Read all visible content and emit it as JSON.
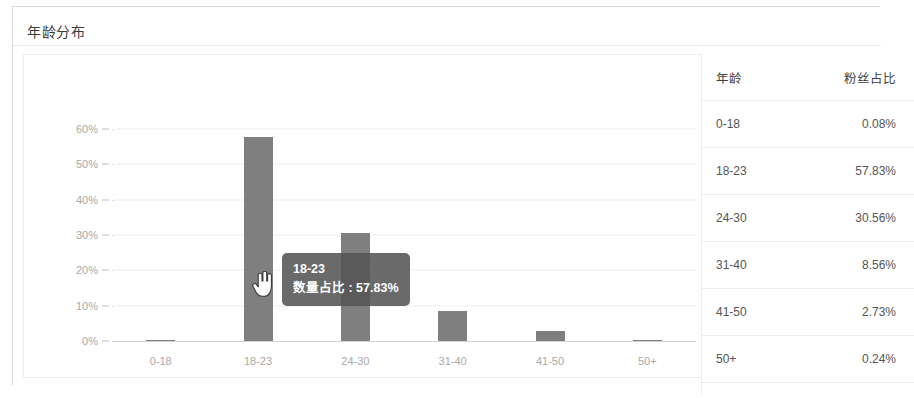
{
  "card": {
    "title": "年龄分布"
  },
  "chart_data": {
    "type": "bar",
    "title": "年龄分布",
    "xlabel": "",
    "ylabel": "",
    "categories": [
      "0-18",
      "18-23",
      "24-30",
      "31-40",
      "41-50",
      "50+"
    ],
    "values": [
      0.08,
      57.83,
      30.56,
      8.56,
      2.73,
      0.24
    ],
    "value_labels": [
      "0.08%",
      "57.83%",
      "30.56%",
      "8.56%",
      "2.73%",
      "0.24%"
    ],
    "ylim": [
      0,
      60
    ],
    "yticks": [
      0,
      10,
      20,
      30,
      40,
      50,
      60
    ],
    "ytick_labels": [
      "0%",
      "10%",
      "20%",
      "30%",
      "40%",
      "50%",
      "60%"
    ],
    "grid": true,
    "legend": "none",
    "bar_color": "#7f7f7f",
    "series": [
      {
        "name": "数量占比",
        "values": [
          0.08,
          57.83,
          30.56,
          8.56,
          2.73,
          0.24
        ]
      }
    ]
  },
  "tooltip": {
    "title": "18-23",
    "metric_label": "数量占比",
    "separator": " : ",
    "value": "57.83%",
    "row_text": "数量占比 : 57.83%",
    "background": "#555555"
  },
  "cursor": {
    "type": "pointer-hand",
    "x": 228,
    "y": 216
  },
  "table": {
    "headers": [
      "年龄",
      "粉丝占比"
    ],
    "rows": [
      {
        "age": "0-18",
        "pct": "0.08%"
      },
      {
        "age": "18-23",
        "pct": "57.83%"
      },
      {
        "age": "24-30",
        "pct": "30.56%"
      },
      {
        "age": "31-40",
        "pct": "8.56%"
      },
      {
        "age": "41-50",
        "pct": "2.73%"
      },
      {
        "age": "50+",
        "pct": "0.24%"
      }
    ]
  }
}
